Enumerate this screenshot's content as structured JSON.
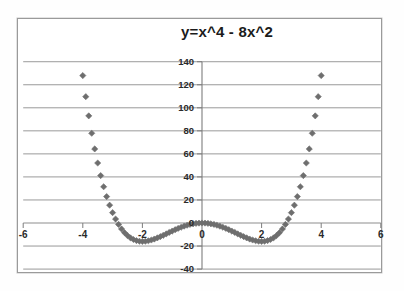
{
  "chart_data": {
    "type": "scatter",
    "title": "y=x^4 - 8x^2",
    "xlabel": "",
    "ylabel": "",
    "xlim": [
      -6,
      6
    ],
    "ylim": [
      -40,
      140
    ],
    "xticks": [
      -6,
      -4,
      -2,
      0,
      2,
      4,
      6
    ],
    "yticks": [
      -40,
      -20,
      0,
      20,
      40,
      60,
      80,
      100,
      120,
      140
    ],
    "xtick_labels": [
      "-6",
      "-4",
      "-2",
      "0",
      "2",
      "4",
      "6"
    ],
    "ytick_labels": [
      "-40",
      "-20",
      "0",
      "20",
      "40",
      "60",
      "80",
      "100",
      "120",
      "140"
    ],
    "grid": "horizontal",
    "legend": "none",
    "marker": "diamond",
    "marker_color": "#6e6e6e",
    "series": [
      {
        "name": "y=x^4 - 8x^2",
        "formula": "y = x^4 - 8*x^2",
        "x_start": -4.0,
        "x_end": 4.0,
        "x_step": 0.1,
        "key_points": [
          {
            "x": -4.0,
            "y": 128
          },
          {
            "x": -3.5,
            "y": 52.06
          },
          {
            "x": -3.0,
            "y": 9
          },
          {
            "x": -2.5,
            "y": -10.94
          },
          {
            "x": -2.0,
            "y": -16
          },
          {
            "x": -1.5,
            "y": -12.94
          },
          {
            "x": -1.0,
            "y": -7
          },
          {
            "x": 0.0,
            "y": 0
          },
          {
            "x": 1.0,
            "y": -7
          },
          {
            "x": 1.5,
            "y": -12.94
          },
          {
            "x": 2.0,
            "y": -16
          },
          {
            "x": 2.5,
            "y": -10.94
          },
          {
            "x": 3.0,
            "y": 9
          },
          {
            "x": 3.5,
            "y": 52.06
          },
          {
            "x": 4.0,
            "y": 128
          }
        ]
      }
    ]
  },
  "colors": {
    "marker": "#6e6e6e",
    "gridline": "#8d8d8d",
    "axis": "#7d7d7d",
    "border": "#9a9a9a",
    "text": "#2a2a2a"
  }
}
